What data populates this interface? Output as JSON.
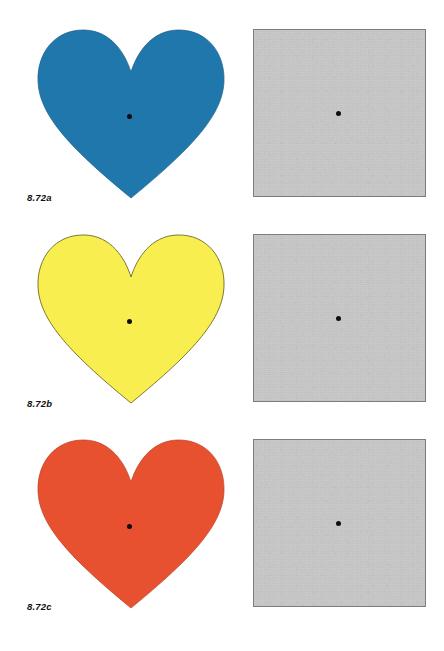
{
  "figure": {
    "page_background": "#ffffff",
    "fixation_dot_color": "#100d0b",
    "gray_patch": {
      "fill": "#c9c9c9",
      "border": "#7d7d7d",
      "name": "gray-adaptation-square"
    },
    "rows": [
      {
        "label": "8.72a",
        "heart_name": "blue-heart",
        "heart_fill": "#2077ab",
        "heart_stroke": "#1a5f8a",
        "heart_color_name": "blue",
        "gray_label": "gray test square"
      },
      {
        "label": "8.72b",
        "heart_name": "yellow-heart",
        "heart_fill": "#f9ee4f",
        "heart_stroke": "#6e6a20",
        "heart_color_name": "yellow",
        "gray_label": "gray test square"
      },
      {
        "label": "8.72c",
        "heart_name": "red-heart",
        "heart_fill": "#e8512f",
        "heart_stroke": "#b93f22",
        "heart_color_name": "red-orange",
        "gray_label": "gray test square"
      }
    ]
  }
}
